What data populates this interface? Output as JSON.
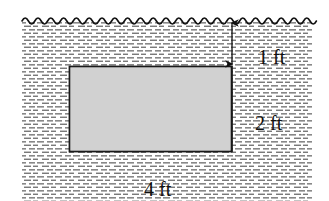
{
  "figure": {
    "type": "engineering-schematic",
    "width": 329,
    "height": 201,
    "background_color": "#ffffff"
  },
  "water": {
    "name": "water-body",
    "hatch_style": "short-horizontal-dashes",
    "hatch_color": "#555555",
    "surface_style": "wavy-line",
    "surface_color": "#111111",
    "region": {
      "x": 22,
      "y": 20,
      "width": 290,
      "height": 181
    }
  },
  "block": {
    "name": "submerged-block",
    "fill_color": "#cfcfcf",
    "stroke_color": "#1a1a1a",
    "region": {
      "x": 69,
      "y": 66,
      "width": 163,
      "height": 86
    }
  },
  "dimensions": [
    {
      "id": "depth-to-top",
      "value": "1",
      "unit": "ft",
      "orientation": "vertical",
      "arrow": "double-headed",
      "from_y": 21,
      "to_y": 66,
      "x": 232
    },
    {
      "id": "block-height",
      "value": "2",
      "unit": "ft",
      "orientation": "vertical",
      "arrow": "none",
      "from_y": 66,
      "to_y": 152,
      "x": 232
    },
    {
      "id": "block-width",
      "value": "4",
      "unit": "ft",
      "orientation": "horizontal",
      "arrow": "none",
      "from_x": 69,
      "to_x": 232,
      "y": 163
    }
  ]
}
